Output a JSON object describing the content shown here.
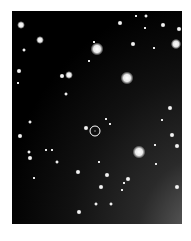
{
  "image": {
    "type": "star-field-finder-chart",
    "background": "#000000",
    "frame": {
      "x": 12,
      "y": 11,
      "width": 170,
      "height": 213
    },
    "target_marker": {
      "x": 95,
      "y": 131,
      "r": 5,
      "color": "#ffffff"
    },
    "stars": [
      {
        "x": 97,
        "y": 49,
        "r": 5
      },
      {
        "x": 127,
        "y": 78,
        "r": 5
      },
      {
        "x": 139,
        "y": 152,
        "r": 5
      },
      {
        "x": 176,
        "y": 44,
        "r": 4
      },
      {
        "x": 21,
        "y": 25,
        "r": 3
      },
      {
        "x": 40,
        "y": 40,
        "r": 3
      },
      {
        "x": 69,
        "y": 75,
        "r": 3
      },
      {
        "x": 62,
        "y": 76,
        "r": 2
      },
      {
        "x": 120,
        "y": 23,
        "r": 2
      },
      {
        "x": 133,
        "y": 44,
        "r": 2
      },
      {
        "x": 163,
        "y": 25,
        "r": 2
      },
      {
        "x": 179,
        "y": 29,
        "r": 2
      },
      {
        "x": 86,
        "y": 128,
        "r": 2
      },
      {
        "x": 20,
        "y": 136,
        "r": 2
      },
      {
        "x": 30,
        "y": 158,
        "r": 2
      },
      {
        "x": 78,
        "y": 172,
        "r": 2
      },
      {
        "x": 107,
        "y": 175,
        "r": 2
      },
      {
        "x": 101,
        "y": 187,
        "r": 2
      },
      {
        "x": 79,
        "y": 212,
        "r": 2
      },
      {
        "x": 177,
        "y": 187,
        "r": 2
      },
      {
        "x": 172,
        "y": 135,
        "r": 2
      },
      {
        "x": 19,
        "y": 71,
        "r": 2
      },
      {
        "x": 177,
        "y": 146,
        "r": 2
      },
      {
        "x": 128,
        "y": 179,
        "r": 2
      },
      {
        "x": 170,
        "y": 108,
        "r": 2
      },
      {
        "x": 96,
        "y": 204,
        "r": 1.5
      },
      {
        "x": 111,
        "y": 204,
        "r": 1.5
      },
      {
        "x": 66,
        "y": 94,
        "r": 1.5
      },
      {
        "x": 57,
        "y": 162,
        "r": 1.5
      },
      {
        "x": 30,
        "y": 122,
        "r": 1.5
      },
      {
        "x": 24,
        "y": 50,
        "r": 1.5
      },
      {
        "x": 146,
        "y": 16,
        "r": 1.5
      },
      {
        "x": 29,
        "y": 152,
        "r": 1.5
      },
      {
        "x": 18,
        "y": 83,
        "r": 1
      },
      {
        "x": 136,
        "y": 16,
        "r": 1
      },
      {
        "x": 162,
        "y": 120,
        "r": 1
      },
      {
        "x": 155,
        "y": 145,
        "r": 1
      },
      {
        "x": 122,
        "y": 190,
        "r": 1
      },
      {
        "x": 94,
        "y": 42,
        "r": 1
      },
      {
        "x": 145,
        "y": 28,
        "r": 1
      },
      {
        "x": 154,
        "y": 48,
        "r": 1
      },
      {
        "x": 89,
        "y": 61,
        "r": 1
      },
      {
        "x": 106,
        "y": 119,
        "r": 1
      },
      {
        "x": 110,
        "y": 124,
        "r": 1
      },
      {
        "x": 46,
        "y": 150,
        "r": 1
      },
      {
        "x": 52,
        "y": 150,
        "r": 1
      },
      {
        "x": 34,
        "y": 178,
        "r": 1
      },
      {
        "x": 124,
        "y": 183,
        "r": 1
      },
      {
        "x": 99,
        "y": 162,
        "r": 1
      },
      {
        "x": 156,
        "y": 164,
        "r": 1
      }
    ]
  }
}
